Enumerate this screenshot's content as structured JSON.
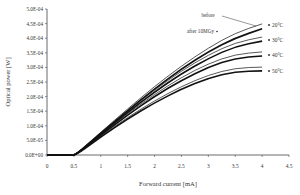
{
  "chart_data": {
    "type": "line",
    "title": "",
    "xlabel": "Forward current [mA]",
    "ylabel": "Optical power [W]",
    "xlim": [
      0,
      4.5
    ],
    "ylim": [
      0,
      0.0005
    ],
    "grid": false,
    "x_ticks": [
      "0",
      "0.5",
      "1",
      "1.5",
      "2",
      "2.5",
      "3",
      "3.5",
      "4",
      "4.5"
    ],
    "y_ticks": [
      "0.0E+00",
      "5.0E-05",
      "1.0E-04",
      "1.5E-04",
      "2.0E-04",
      "2.5E-04",
      "3.0E-04",
      "3.5E-04",
      "4.0E-04",
      "4.5E-04",
      "5.0E-04"
    ],
    "annotations": [
      {
        "text": "before",
        "points_to": "20°C before (upper thin curve)"
      },
      {
        "text": "after 10MGy",
        "points_to": "20°C after 10MGy (lower thick curve)"
      }
    ],
    "legend": [
      "20°C",
      "30°C",
      "40°C",
      "50°C"
    ],
    "legend_position": "right",
    "x": [
      0,
      0.5,
      0.6,
      1.0,
      1.5,
      2.0,
      2.5,
      3.0,
      3.5,
      4.0
    ],
    "series": [
      {
        "name": "20°C before",
        "style": "thin",
        "values": [
          0,
          0,
          1.2e-05,
          7.8e-05,
          0.000158,
          0.000235,
          0.000305,
          0.000367,
          0.000418,
          0.000449
        ]
      },
      {
        "name": "20°C after 10MGy",
        "style": "thick",
        "values": [
          0,
          0,
          1.1e-05,
          7.5e-05,
          0.000152,
          0.000227,
          0.000295,
          0.000354,
          0.000401,
          0.000432
        ]
      },
      {
        "name": "30°C before",
        "style": "thin",
        "values": [
          0,
          0,
          1.1e-05,
          7.5e-05,
          0.00015,
          0.000223,
          0.000288,
          0.000343,
          0.000385,
          0.000404
        ]
      },
      {
        "name": "30°C after 10MGy",
        "style": "thick",
        "values": [
          0,
          0,
          1e-05,
          7.2e-05,
          0.000146,
          0.000216,
          0.000279,
          0.000331,
          0.000372,
          0.00039
        ]
      },
      {
        "name": "40°C before",
        "style": "thin",
        "values": [
          0,
          0,
          1e-05,
          7.1e-05,
          0.000142,
          0.000208,
          0.000266,
          0.000313,
          0.000345,
          0.000353
        ]
      },
      {
        "name": "40°C after 10MGy",
        "style": "thick",
        "values": [
          0,
          0,
          1e-05,
          6.8e-05,
          0.000137,
          0.000201,
          0.000256,
          0.000301,
          0.000332,
          0.000339
        ]
      },
      {
        "name": "50°C before",
        "style": "thin",
        "values": [
          0,
          0,
          9e-06,
          6.5e-05,
          0.000129,
          0.000186,
          0.000235,
          0.000274,
          0.000298,
          0.000301
        ]
      },
      {
        "name": "50°C after 10MGy",
        "style": "thick",
        "values": [
          0,
          0,
          8e-06,
          6.2e-05,
          0.000124,
          0.000179,
          0.000226,
          0.000263,
          0.000286,
          0.000288
        ]
      }
    ]
  }
}
